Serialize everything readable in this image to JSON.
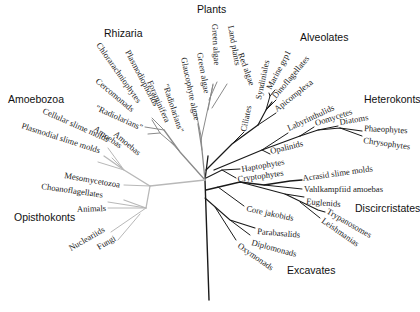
{
  "diagram": {
    "type": "unrooted-phylogenetic-tree",
    "colors": {
      "unikont_branch": "#b8b8b8",
      "plants_rhizaria_branch": "#8a8a8a",
      "bikont_branch": "#1a1a1a",
      "text": "#222222"
    },
    "groups": [
      {
        "id": "plants",
        "label": "Plants",
        "x": 197,
        "y": 13
      },
      {
        "id": "rhizaria",
        "label": "Rhizaria",
        "x": 104,
        "y": 37
      },
      {
        "id": "alveolates",
        "label": "Alveolates",
        "x": 300,
        "y": 41
      },
      {
        "id": "heterokonts",
        "label": "Heterokonts",
        "x": 364,
        "y": 103
      },
      {
        "id": "amoebozoa",
        "label": "Amoebozoa",
        "x": 8,
        "y": 103
      },
      {
        "id": "opisthokonts",
        "label": "Opisthokonts",
        "x": 14,
        "y": 221
      },
      {
        "id": "discicristates",
        "label": "Discircristates",
        "x": 355,
        "y": 212
      },
      {
        "id": "excavates",
        "label": "Excavates",
        "x": 287,
        "y": 274
      }
    ],
    "leaves": [
      {
        "id": "land-plants",
        "label": "Land plants",
        "x": 228,
        "y": 26,
        "rot": 80,
        "anchor": "start"
      },
      {
        "id": "green-algae-1",
        "label": "Green algae",
        "x": 212,
        "y": 24,
        "rot": 87,
        "anchor": "start"
      },
      {
        "id": "red-algae",
        "label": "Red algae",
        "x": 238,
        "y": 54,
        "rot": 70,
        "anchor": "start"
      },
      {
        "id": "green-algae-2",
        "label": "Green algae",
        "x": 197,
        "y": 53,
        "rot": 80,
        "anchor": "start"
      },
      {
        "id": "glaucophyte-algae",
        "label": "Glaucophyte algae",
        "x": 181,
        "y": 58,
        "rot": 78,
        "anchor": "start"
      },
      {
        "id": "radiolarians-1",
        "label": "\"Radiolarians\"",
        "x": 163,
        "y": 85,
        "rot": 72,
        "anchor": "start"
      },
      {
        "id": "foraminifera",
        "label": "Foraminifera",
        "x": 147,
        "y": 82,
        "rot": 66,
        "anchor": "start"
      },
      {
        "id": "plasmodiophorids",
        "label": "Plasmodiophorids",
        "x": 125,
        "y": 52,
        "rot": 62,
        "anchor": "start"
      },
      {
        "id": "chlorarachniophytes",
        "label": "Chlorarachniophytes",
        "x": 96,
        "y": 45,
        "rot": 55,
        "anchor": "start"
      },
      {
        "id": "cercomonads",
        "label": "Cercomonads",
        "x": 95,
        "y": 82,
        "rot": 40,
        "anchor": "start"
      },
      {
        "id": "radiolarians-2",
        "label": "\"Radiolarians\"",
        "x": 95,
        "y": 110,
        "rot": 24,
        "anchor": "start"
      },
      {
        "id": "amoebas-1",
        "label": "Amoebas",
        "x": 113,
        "y": 135,
        "rot": 40,
        "anchor": "start"
      },
      {
        "id": "amoebas-2",
        "label": "Amoebas",
        "x": 93,
        "y": 130,
        "rot": 35,
        "anchor": "start"
      },
      {
        "id": "cellular-slime-molds",
        "label": "Cellular slime molds",
        "x": 42,
        "y": 113,
        "rot": 24,
        "anchor": "start"
      },
      {
        "id": "plasmodial-slime-molds",
        "label": "Plasmodial slime molds",
        "x": 21,
        "y": 128,
        "rot": 18,
        "anchor": "start"
      },
      {
        "id": "mesomycetozoa",
        "label": "Mesomycetozoa",
        "x": 64,
        "y": 178,
        "rot": 10,
        "anchor": "start"
      },
      {
        "id": "choanoflagellates",
        "label": "Choanoflagellates",
        "x": 41,
        "y": 189,
        "rot": 8,
        "anchor": "start"
      },
      {
        "id": "animals",
        "label": "Animals",
        "x": 77,
        "y": 212,
        "rot": -2,
        "anchor": "start"
      },
      {
        "id": "nucleariids",
        "label": "Nucleariids",
        "x": 71,
        "y": 251,
        "rot": -30,
        "anchor": "start"
      },
      {
        "id": "fungi",
        "label": "Fungi",
        "x": 99,
        "y": 250,
        "rot": -30,
        "anchor": "start"
      },
      {
        "id": "ciliates",
        "label": "Ciliates",
        "x": 246,
        "y": 132,
        "rot": -78,
        "anchor": "start"
      },
      {
        "id": "syndiniales",
        "label": "Syndiniales",
        "x": 261,
        "y": 100,
        "rot": -78,
        "anchor": "start"
      },
      {
        "id": "marine-grp1",
        "label": "Marine grp1",
        "x": 271,
        "y": 90,
        "rot": -62,
        "anchor": "start"
      },
      {
        "id": "dinoflagellates",
        "label": "Dinoflagellates",
        "x": 276,
        "y": 99,
        "rot": -50,
        "anchor": "start"
      },
      {
        "id": "apicomplexa",
        "label": "Apicomplexa",
        "x": 277,
        "y": 112,
        "rot": -38,
        "anchor": "start"
      },
      {
        "id": "labyrinthulids",
        "label": "Labyrinthulids",
        "x": 289,
        "y": 131,
        "rot": -25,
        "anchor": "start"
      },
      {
        "id": "oomycetes",
        "label": "Oomycetes",
        "x": 316,
        "y": 126,
        "rot": -18,
        "anchor": "start"
      },
      {
        "id": "diatoms",
        "label": "Diatoms",
        "x": 340,
        "y": 125,
        "rot": -10,
        "anchor": "start"
      },
      {
        "id": "phaeophytes",
        "label": "Phaeophytes",
        "x": 364,
        "y": 131,
        "rot": 3,
        "anchor": "start"
      },
      {
        "id": "chrysophytes",
        "label": "Chrysophytes",
        "x": 363,
        "y": 143,
        "rot": 8,
        "anchor": "start"
      },
      {
        "id": "opalinids",
        "label": "Opalinids",
        "x": 271,
        "y": 154,
        "rot": -14,
        "anchor": "start"
      },
      {
        "id": "haptophytes",
        "label": "Haptophytes",
        "x": 242,
        "y": 172,
        "rot": -10,
        "anchor": "start"
      },
      {
        "id": "cryptophytes",
        "label": "Cryptophytes",
        "x": 238,
        "y": 182,
        "rot": -8,
        "anchor": "start"
      },
      {
        "id": "acrasid-slime-molds",
        "label": "Acrasid slime molds",
        "x": 303,
        "y": 181,
        "rot": -8,
        "anchor": "start"
      },
      {
        "id": "vahlkampfiid-amoebas",
        "label": "Vahlkampfiid amoebas",
        "x": 304,
        "y": 192,
        "rot": 0,
        "anchor": "start"
      },
      {
        "id": "euglenids",
        "label": "Euglenids",
        "x": 306,
        "y": 204,
        "rot": 5,
        "anchor": "start"
      },
      {
        "id": "trypanosomes",
        "label": "Trypanosomes",
        "x": 326,
        "y": 213,
        "rot": 30,
        "anchor": "start"
      },
      {
        "id": "leishmanias",
        "label": "Leishmanias",
        "x": 321,
        "y": 222,
        "rot": 35,
        "anchor": "start"
      },
      {
        "id": "core-jakobids",
        "label": "Core jakobids",
        "x": 246,
        "y": 211,
        "rot": 12,
        "anchor": "start"
      },
      {
        "id": "parabasalids",
        "label": "Parabasalids",
        "x": 257,
        "y": 234,
        "rot": 5,
        "anchor": "start"
      },
      {
        "id": "diplomonads",
        "label": "Diplomonads",
        "x": 251,
        "y": 245,
        "rot": 15,
        "anchor": "start"
      },
      {
        "id": "oxymonads",
        "label": "Oxymonads",
        "x": 237,
        "y": 247,
        "rot": 35,
        "anchor": "start"
      }
    ],
    "branches": [
      {
        "tone": "bikont",
        "w": 1.4,
        "d": "M209,300 L205,180"
      },
      {
        "tone": "bikont",
        "w": 1.3,
        "d": "M205,180 L208,156"
      },
      {
        "tone": "bikont",
        "w": 1.3,
        "d": "M206,170 L232,144 L258,125"
      },
      {
        "tone": "bikont",
        "w": 1.0,
        "d": "M232,144 L244,132"
      },
      {
        "tone": "bikont",
        "w": 1.2,
        "d": "M258,125 L266,110 L272,102"
      },
      {
        "tone": "bikont",
        "w": 1.0,
        "d": "M266,110 L270,96 L269,93"
      },
      {
        "tone": "bikont",
        "w": 1.0,
        "d": "M270,96 L275,90"
      },
      {
        "tone": "bikont",
        "w": 1.0,
        "d": "M266,110 L276,100"
      },
      {
        "tone": "bikont",
        "w": 1.0,
        "d": "M258,125 L276,113"
      },
      {
        "tone": "bikont",
        "w": 1.3,
        "d": "M214,170 L262,150 L300,136"
      },
      {
        "tone": "bikont",
        "w": 1.0,
        "d": "M262,150 L288,133"
      },
      {
        "tone": "bikont",
        "w": 1.2,
        "d": "M300,136 L318,130 L340,128 L362,131"
      },
      {
        "tone": "bikont",
        "w": 1.0,
        "d": "M300,136 L314,127"
      },
      {
        "tone": "bikont",
        "w": 1.0,
        "d": "M318,130 L338,126"
      },
      {
        "tone": "bikont",
        "w": 1.0,
        "d": "M340,128 L362,136"
      },
      {
        "tone": "bikont",
        "w": 1.0,
        "d": "M262,150 L270,154"
      },
      {
        "tone": "bikont",
        "w": 1.1,
        "d": "M206,178 L222,170 L240,169"
      },
      {
        "tone": "bikont",
        "w": 1.0,
        "d": "M222,170 L236,178"
      },
      {
        "tone": "bikont",
        "w": 1.3,
        "d": "M206,190 L240,182 L264,185 L290,181 L302,180"
      },
      {
        "tone": "bikont",
        "w": 1.0,
        "d": "M264,185 L302,189"
      },
      {
        "tone": "bikont",
        "w": 1.1,
        "d": "M240,182 L285,194 L304,197"
      },
      {
        "tone": "bikont",
        "w": 1.1,
        "d": "M285,194 L318,210 L325,212"
      },
      {
        "tone": "bikont",
        "w": 1.0,
        "d": "M300,202 L320,218"
      },
      {
        "tone": "bikont",
        "w": 1.0,
        "d": "M218,187 L244,206"
      },
      {
        "tone": "bikont",
        "w": 1.1,
        "d": "M205,198 L230,220 L255,228"
      },
      {
        "tone": "bikont",
        "w": 1.0,
        "d": "M230,220 L250,235"
      },
      {
        "tone": "bikont",
        "w": 1.0,
        "d": "M215,207 L236,240"
      },
      {
        "tone": "plants",
        "w": 1.3,
        "d": "M205,180 L202,150 L198,124"
      },
      {
        "tone": "plants",
        "w": 1.0,
        "d": "M202,150 L201,136 L196,112"
      },
      {
        "tone": "plants",
        "w": 1.0,
        "d": "M201,140 L213,85"
      },
      {
        "tone": "plants",
        "w": 1.0,
        "d": "M208,110 L213,84"
      },
      {
        "tone": "plants",
        "w": 1.0,
        "d": "M209,100 L217,82"
      },
      {
        "tone": "plants",
        "w": 1.0,
        "d": "M212,108 L227,84"
      },
      {
        "tone": "plants",
        "w": 1.3,
        "d": "M205,180 L180,152 L164,130"
      },
      {
        "tone": "plants",
        "w": 1.0,
        "d": "M180,152 L171,142"
      },
      {
        "tone": "plants",
        "w": 1.0,
        "d": "M174,145 L160,133 L152,120"
      },
      {
        "tone": "plants",
        "w": 1.0,
        "d": "M164,130 L152,118"
      },
      {
        "tone": "plants",
        "w": 1.0,
        "d": "M164,130 L145,127"
      },
      {
        "tone": "plants",
        "w": 1.0,
        "d": "M160,133 L148,134"
      },
      {
        "tone": "unikont",
        "w": 1.3,
        "d": "M205,180 L150,186 L124,170 L104,156"
      },
      {
        "tone": "unikont",
        "w": 1.0,
        "d": "M124,170 L112,158"
      },
      {
        "tone": "unikont",
        "w": 1.0,
        "d": "M124,170 L98,162"
      },
      {
        "tone": "unikont",
        "w": 1.0,
        "d": "M124,170 L108,148"
      },
      {
        "tone": "unikont",
        "w": 1.0,
        "d": "M150,186 L124,185"
      },
      {
        "tone": "unikont",
        "w": 1.3,
        "d": "M150,186 L146,208 L124,200"
      },
      {
        "tone": "unikont",
        "w": 1.0,
        "d": "M146,208 L108,208"
      },
      {
        "tone": "unikont",
        "w": 1.0,
        "d": "M146,208 L108,202"
      },
      {
        "tone": "unikont",
        "w": 1.0,
        "d": "M146,208 L111,232"
      },
      {
        "tone": "unikont",
        "w": 1.0,
        "d": "M140,214 L118,240"
      }
    ]
  }
}
